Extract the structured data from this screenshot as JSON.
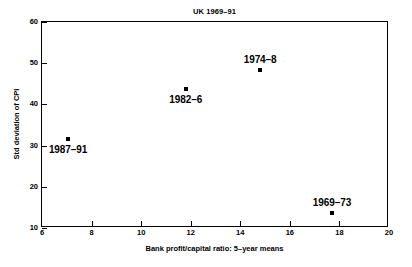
{
  "chart_data": {
    "type": "scatter",
    "title": "UK 1969–91",
    "xlabel": "Bank profit/capital ratio: 5–year means",
    "ylabel": "Std deviation of CPI",
    "xlim": [
      6,
      20
    ],
    "ylim": [
      10,
      60
    ],
    "xticks": [
      6,
      8,
      10,
      12,
      14,
      16,
      18,
      20
    ],
    "yticks": [
      10,
      20,
      30,
      40,
      50,
      60
    ],
    "xtick_labels": [
      "6",
      "8",
      "10",
      "12",
      "14",
      "16",
      "18",
      "20"
    ],
    "ytick_labels": [
      "10",
      "20",
      "30",
      "40",
      "50",
      "60"
    ],
    "grid": false,
    "legend": "none",
    "marker": "filled-square",
    "marker_color": "#000000",
    "points": [
      {
        "label": "1987–91",
        "x": 7.05,
        "y": 31.6,
        "label_position": "below"
      },
      {
        "label": "1982–6",
        "x": 11.8,
        "y": 43.7,
        "label_position": "below"
      },
      {
        "label": "1974–8",
        "x": 14.8,
        "y": 48.3,
        "label_position": "above"
      },
      {
        "label": "1969–73",
        "x": 17.7,
        "y": 13.6,
        "label_position": "above"
      }
    ]
  }
}
